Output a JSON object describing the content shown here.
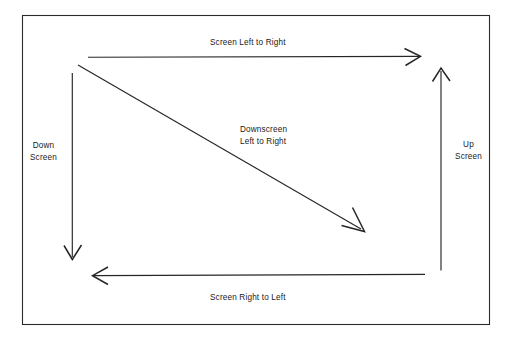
{
  "diagram": {
    "background_color": "#ffffff",
    "stroke_color": "#1a1a1a",
    "border": {
      "name": "outer-frame",
      "x": 22,
      "y": 15,
      "width": 468,
      "height": 310
    },
    "labels": {
      "screen_left_to_right": "Screen Left to Right",
      "screen_right_to_left": "Screen Right to Left",
      "down_screen": "Down\nScreen",
      "up_screen": "Up\nScreen",
      "downscreen_left_to_right": "Downscreen\nLeft to Right"
    },
    "arrows": [
      {
        "name": "arrow-screen-left-to-right",
        "direction": "right",
        "from": [
          88,
          57
        ],
        "to": [
          420,
          57
        ]
      },
      {
        "name": "arrow-down-screen",
        "direction": "down",
        "from": [
          72,
          73
        ],
        "to": [
          72,
          260
        ]
      },
      {
        "name": "arrow-up-screen",
        "direction": "up",
        "from": [
          441,
          270
        ],
        "to": [
          441,
          68
        ]
      },
      {
        "name": "arrow-screen-right-to-left",
        "direction": "left",
        "from": [
          425,
          275
        ],
        "to": [
          93,
          275
        ]
      },
      {
        "name": "arrow-downscreen-left-to-right",
        "direction": "diagonal-down-right",
        "from": [
          78,
          65
        ],
        "to": [
          364,
          231
        ]
      }
    ]
  }
}
